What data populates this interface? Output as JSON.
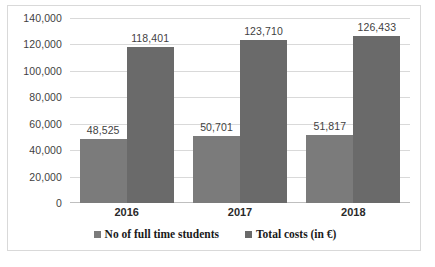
{
  "chart_data": {
    "type": "bar",
    "title": "",
    "xlabel": "",
    "ylabel": "",
    "categories": [
      "2016",
      "2017",
      "2018"
    ],
    "series": [
      {
        "name": "No of full time students",
        "color": "#7b7b7b",
        "values": [
          48525,
          50701,
          51817
        ],
        "labels": [
          "48,525",
          "50,701",
          "51,817"
        ]
      },
      {
        "name": "Total costs (in €)",
        "color": "#6a6a6a",
        "values": [
          118401,
          123710,
          126433
        ],
        "labels": [
          "118,401",
          "123,710",
          "126,433"
        ]
      }
    ],
    "ylim": [
      0,
      140000
    ],
    "ytick_values": [
      0,
      20000,
      40000,
      60000,
      80000,
      100000,
      120000,
      140000
    ],
    "ytick_labels": [
      "0",
      "20,000",
      "40,000",
      "60,000",
      "80,000",
      "100,000",
      "120,000",
      "140,000"
    ],
    "grid": true,
    "legend_position": "bottom"
  }
}
